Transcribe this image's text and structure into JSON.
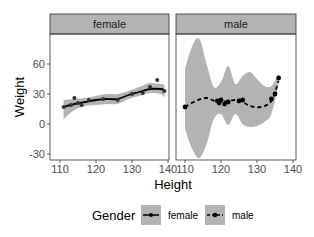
{
  "chart_data": {
    "type": "line",
    "facets": [
      "female",
      "male"
    ],
    "xlabel": "Height",
    "ylabel": "Weight",
    "x_ticks": [
      110,
      120,
      130,
      140
    ],
    "y_ticks": [
      -30,
      0,
      30,
      60
    ],
    "xlim": [
      107,
      141
    ],
    "ylim": [
      -33,
      83
    ],
    "grid": false,
    "legend": {
      "title": "Gender",
      "position": "bottom",
      "entries": [
        {
          "label": "female",
          "linetype": "solid"
        },
        {
          "label": "male",
          "linetype": "dashed"
        }
      ]
    },
    "series": [
      {
        "name": "female",
        "facet": "female",
        "points": [
          [
            111,
            17
          ],
          [
            113,
            19
          ],
          [
            114,
            26
          ],
          [
            115,
            21
          ],
          [
            116,
            19
          ],
          [
            118,
            24
          ],
          [
            122,
            25
          ],
          [
            126,
            24
          ],
          [
            130,
            30
          ],
          [
            133,
            31
          ],
          [
            135,
            37
          ],
          [
            137,
            44
          ],
          [
            139,
            33
          ]
        ],
        "smooth": [
          [
            111,
            17
          ],
          [
            114,
            20
          ],
          [
            117,
            22
          ],
          [
            120,
            24
          ],
          [
            123,
            25
          ],
          [
            126,
            25
          ],
          [
            129,
            29
          ],
          [
            132,
            32
          ],
          [
            135,
            35
          ],
          [
            138,
            35
          ],
          [
            139,
            34
          ]
        ],
        "band_upper": [
          [
            111,
            24
          ],
          [
            114,
            25
          ],
          [
            117,
            26
          ],
          [
            120,
            28
          ],
          [
            123,
            30
          ],
          [
            126,
            30
          ],
          [
            129,
            33
          ],
          [
            132,
            37
          ],
          [
            135,
            41
          ],
          [
            138,
            40
          ],
          [
            139,
            39
          ]
        ],
        "band_lower": [
          [
            111,
            5
          ],
          [
            114,
            14
          ],
          [
            117,
            18
          ],
          [
            120,
            19
          ],
          [
            123,
            20
          ],
          [
            126,
            20
          ],
          [
            129,
            25
          ],
          [
            132,
            28
          ],
          [
            135,
            31
          ],
          [
            138,
            30
          ],
          [
            139,
            26
          ]
        ]
      },
      {
        "name": "male",
        "facet": "male",
        "points": [
          [
            110,
            17
          ],
          [
            119,
            23
          ],
          [
            119.5,
            21
          ],
          [
            120,
            24
          ],
          [
            121,
            20
          ],
          [
            122,
            22
          ],
          [
            125,
            23
          ],
          [
            126,
            24
          ],
          [
            134,
            25
          ],
          [
            135,
            30
          ],
          [
            136,
            46
          ]
        ],
        "smooth": [
          [
            110,
            17
          ],
          [
            113,
            23
          ],
          [
            116,
            26
          ],
          [
            119,
            22
          ],
          [
            122,
            23
          ],
          [
            125,
            24
          ],
          [
            128,
            18
          ],
          [
            131,
            17
          ],
          [
            134,
            23
          ],
          [
            136,
            43
          ]
        ],
        "band_upper": [
          [
            110,
            55
          ],
          [
            112,
            78
          ],
          [
            114,
            85
          ],
          [
            116,
            60
          ],
          [
            118,
            37
          ],
          [
            120,
            42
          ],
          [
            122,
            58
          ],
          [
            124,
            40
          ],
          [
            126,
            48
          ],
          [
            128,
            52
          ],
          [
            130,
            45
          ],
          [
            132,
            38
          ],
          [
            134,
            38
          ],
          [
            136,
            50
          ]
        ],
        "band_lower": [
          [
            110,
            -5
          ],
          [
            112,
            -25
          ],
          [
            114,
            -34
          ],
          [
            116,
            -20
          ],
          [
            118,
            5
          ],
          [
            120,
            10
          ],
          [
            122,
            -1
          ],
          [
            124,
            10
          ],
          [
            126,
            0
          ],
          [
            128,
            -3
          ],
          [
            130,
            -2
          ],
          [
            132,
            2
          ],
          [
            134,
            10
          ],
          [
            136,
            40
          ]
        ]
      }
    ]
  },
  "colors": {
    "strip_bg": "#b3b3b3",
    "band": "#999999",
    "line": "#000000",
    "panel_border": "#333333"
  }
}
